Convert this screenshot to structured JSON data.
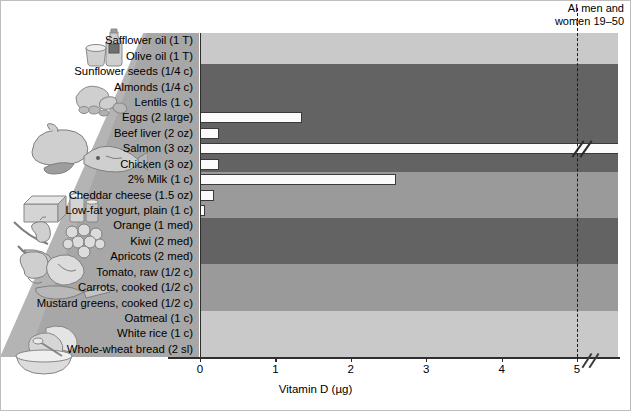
{
  "chart_data": {
    "type": "bar",
    "orientation": "horizontal",
    "title": "",
    "xlabel": "Vitamin D (µg)",
    "ylabel": "",
    "xlim": [
      0,
      5.3
    ],
    "xticks": [
      0,
      1,
      2,
      3,
      4,
      5
    ],
    "xticklabels": [
      "0",
      "1",
      "2",
      "3",
      "4",
      "5"
    ],
    "grid": false,
    "legend": "none",
    "reference_line": {
      "label_line1": "AI men and",
      "label_line2": "women 19–50",
      "value": 5,
      "style": "dashed"
    },
    "categories": [
      "Safflower oil (1 T)",
      "Olive oil (1 T)",
      "Sunflower seeds (1/4 c)",
      "Almonds (1/4 c)",
      "Lentils (1 c)",
      "Eggs (2 large)",
      "Beef liver (2 oz)",
      "Salmon (3 oz)",
      "Chicken (3 oz)",
      "2% Milk (1 c)",
      "Cheddar cheese (1.5 oz)",
      "Low-fat yogurt, plain (1 c)",
      "Orange (1 med)",
      "Kiwi (2 med)",
      "Apricots (2 med)",
      "Tomato, raw (1/2 c)",
      "Carrots, cooked (1/2 c)",
      "Mustard greens, cooked (1/2 c)",
      "Oatmeal (1 c)",
      "White rice (1 c)",
      "Whole-wheat bread (2 sl)"
    ],
    "values": [
      0,
      0,
      0,
      0,
      0,
      1.35,
      0.25,
      5.3,
      0.25,
      2.6,
      0.18,
      0.06,
      0,
      0,
      0,
      0,
      0,
      0,
      0,
      0,
      0
    ],
    "offscale_index": 7,
    "offscale_note": "bar extends beyond axis with break mark",
    "bands": [
      {
        "name": "oils",
        "from": 0,
        "to": 1,
        "color": "#c9c9c9"
      },
      {
        "name": "nuts-legumes-protein",
        "from": 2,
        "to": 11,
        "color": "#636363"
      },
      {
        "name": "dairy",
        "from": 9,
        "to": 11,
        "color": "#9a9a9a"
      },
      {
        "name": "fruits",
        "from": 12,
        "to": 14,
        "color": "#636363"
      },
      {
        "name": "vegetables",
        "from": 15,
        "to": 17,
        "color": "#9a9a9a"
      },
      {
        "name": "grains",
        "from": 18,
        "to": 20,
        "color": "#c9c9c9"
      }
    ]
  },
  "illustrations": [
    {
      "name": "oils-bottle-and-cup"
    },
    {
      "name": "nuts-and-seeds"
    },
    {
      "name": "poultry-fish-meat"
    },
    {
      "name": "cheese-and-milk"
    },
    {
      "name": "fruits-apple-grapes-banana"
    },
    {
      "name": "vegetables-broccoli-carrot-cabbage"
    },
    {
      "name": "grains-bread-and-cereal-bowl"
    }
  ]
}
